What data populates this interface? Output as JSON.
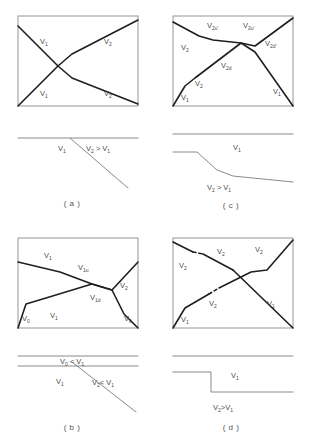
{
  "figure": {
    "panel_count": 4
  },
  "panels": {
    "a": {
      "caption": "( a )",
      "box": {
        "x": 18,
        "y": 16,
        "w": 120,
        "h": 90
      },
      "curves": [
        {
          "name": "v1-descending",
          "points": "18,26 58,66 72,78 138,104"
        },
        {
          "name": "v1-ascending",
          "points": "18,106 58,66 72,54 138,20"
        }
      ],
      "labels": [
        {
          "id": "a-lbl-v1-upper",
          "base": "V",
          "sub": "1",
          "x": 40,
          "y": 44
        },
        {
          "id": "a-lbl-v1-lower",
          "base": "V",
          "sub": "1",
          "x": 40,
          "y": 96
        },
        {
          "id": "a-lbl-v2-upper",
          "base": "V",
          "sub": "2",
          "x": 104,
          "y": 44
        },
        {
          "id": "a-lbl-v2-lower",
          "base": "V",
          "sub": "2",
          "x": 104,
          "y": 96
        }
      ],
      "profile": {
        "baseline": {
          "x1": 18,
          "y1": 138,
          "x2": 138,
          "y2": 138
        },
        "slope": {
          "x1": 70,
          "y1": 138,
          "x2": 128,
          "y2": 188
        },
        "labels": [
          {
            "id": "a-prof-v1",
            "text": "V",
            "sub": "1",
            "x": 58,
            "y": 151
          },
          {
            "id": "a-prof-cmp",
            "text": "V",
            "sub": "2",
            "tail": " > V",
            "tail_sub": "1",
            "x": 86,
            "y": 151
          }
        ]
      }
    },
    "c": {
      "caption": "( c )",
      "box": {
        "x": 18,
        "y": 16,
        "w": 120,
        "h": 90
      },
      "curves": [
        {
          "name": "v2-upper-branch",
          "points": "18,22 44,36 58,40 86,43 100,46 138,18"
        },
        {
          "name": "v2d-ascending",
          "points": "18,106 30,86 40,78 86,43 100,52 138,106"
        }
      ],
      "labels": [
        {
          "id": "c-lbl-v2",
          "base": "V",
          "sub": "2",
          "x": 26,
          "y": 48
        },
        {
          "id": "c-lbl-v2u-prime",
          "base": "V",
          "sub": "2u'",
          "x": 58,
          "y": 28
        },
        {
          "id": "c-lbl-v2b-prime",
          "base": "V",
          "sub": "2u'",
          "x": 92,
          "y": 28
        },
        {
          "id": "c-lbl-v2d-prime",
          "base": "V",
          "sub": "2d'",
          "x": 112,
          "y": 44
        },
        {
          "id": "c-lbl-v2d",
          "base": "V",
          "sub": "2d",
          "x": 70,
          "y": 68
        },
        {
          "id": "c-lbl-v2-low",
          "base": "V",
          "sub": "2",
          "x": 42,
          "y": 86
        },
        {
          "id": "c-lbl-v1-left",
          "base": "V",
          "sub": "1",
          "x": 26,
          "y": 100
        },
        {
          "id": "c-lbl-v1-right",
          "base": "V",
          "sub": "1",
          "x": 120,
          "y": 96
        }
      ],
      "profile": {
        "baseline": {
          "x1": 18,
          "y1": 134,
          "x2": 138,
          "y2": 134
        },
        "step": "18,152 42,152 62,170 78,176 138,182",
        "labels": [
          {
            "id": "c-prof-v1",
            "text": "V",
            "sub": "1",
            "x": 78,
            "y": 150
          },
          {
            "id": "c-prof-cmp",
            "text": "V",
            "sub": "2",
            "tail": " > V",
            "tail_sub": "1",
            "x": 58,
            "y": 186
          }
        ]
      }
    },
    "b": {
      "caption": "( b )",
      "box": {
        "x": 18,
        "y": 16,
        "w": 120,
        "h": 90
      },
      "curves": [
        {
          "name": "v1u-descending",
          "points": "18,40 60,50 92,62 112,68 138,40"
        },
        {
          "name": "v1d-ascending",
          "points": "18,106 26,82 46,76 92,62 112,68 124,92 138,106"
        }
      ],
      "labels": [
        {
          "id": "b-lbl-v1-top",
          "base": "V",
          "sub": "1",
          "x": 44,
          "y": 36
        },
        {
          "id": "b-lbl-v1u",
          "base": "V",
          "sub": "1u",
          "x": 80,
          "y": 48
        },
        {
          "id": "b-lbl-v2",
          "base": "V",
          "sub": "2",
          "x": 120,
          "y": 66
        },
        {
          "id": "b-lbl-v1d",
          "base": "V",
          "sub": "1d",
          "x": 92,
          "y": 78
        },
        {
          "id": "b-lbl-v0-left",
          "base": "V",
          "sub": "0",
          "x": 24,
          "y": 98
        },
        {
          "id": "b-lbl-v1-mid",
          "base": "V",
          "sub": "1",
          "x": 50,
          "y": 96
        },
        {
          "id": "b-lbl-v0-right",
          "base": "V",
          "sub": "0",
          "x": 126,
          "y": 98
        }
      ],
      "profile": {
        "line_top": {
          "x1": 18,
          "y1": 134,
          "x2": 138,
          "y2": 134
        },
        "line_bottom": {
          "x1": 18,
          "y1": 144,
          "x2": 138,
          "y2": 144
        },
        "slope": {
          "x1": 72,
          "y1": 140,
          "x2": 136,
          "y2": 190
        },
        "labels": [
          {
            "id": "b-prof-v0cmp",
            "text": "V",
            "sub": "0",
            "tail": " < V",
            "tail_sub": "1",
            "x": 64,
            "y": 141
          },
          {
            "id": "b-prof-v1",
            "text": "V",
            "sub": "1",
            "x": 58,
            "y": 161
          },
          {
            "id": "b-prof-v2cmp",
            "text": "V",
            "sub": "2",
            "tail": "< V",
            "tail_sub": "1",
            "x": 94,
            "y": 162
          }
        ]
      }
    },
    "d": {
      "caption": "( d )",
      "box": {
        "x": 18,
        "y": 16,
        "w": 120,
        "h": 90
      },
      "curves": [
        {
          "name": "v2-descending-seg1",
          "points": "18,20 38,30"
        },
        {
          "name": "v2-descending-seg2",
          "points": "48,32 78,48"
        },
        {
          "name": "v2-descending-seg3",
          "points": "78,48 138,106"
        },
        {
          "name": "v2-ascending-seg1",
          "points": "18,106 30,86 54,72"
        },
        {
          "name": "v2-ascending-seg2",
          "points": "64,66 96,50 112,48 138,18"
        }
      ],
      "dashes": [
        {
          "name": "gap-upper",
          "x1": 38,
          "y1": 30,
          "x2": 48,
          "y2": 32
        },
        {
          "name": "gap-lower",
          "x1": 54,
          "y1": 72,
          "x2": 64,
          "y2": 66
        }
      ],
      "labels": [
        {
          "id": "d-lbl-v2-left",
          "base": "V",
          "sub": "2",
          "x": 26,
          "y": 44
        },
        {
          "id": "d-lbl-v2-mid",
          "base": "V",
          "sub": "2",
          "x": 64,
          "y": 32
        },
        {
          "id": "d-lbl-v2-right",
          "base": "V",
          "sub": "2",
          "x": 100,
          "y": 30
        },
        {
          "id": "d-lbl-v2-lower",
          "base": "V",
          "sub": "2",
          "x": 56,
          "y": 84
        },
        {
          "id": "d-lbl-v1-left",
          "base": "V",
          "sub": "1",
          "x": 28,
          "y": 100
        },
        {
          "id": "d-lbl-v1-right",
          "base": "V",
          "sub": "1",
          "x": 114,
          "y": 84
        }
      ],
      "profile": {
        "baseline": {
          "x1": 18,
          "y1": 134,
          "x2": 138,
          "y2": 134
        },
        "step": "18,150 56,150 56,170 138,170",
        "labels": [
          {
            "id": "d-prof-v1",
            "text": "V",
            "sub": "1",
            "x": 78,
            "y": 154
          },
          {
            "id": "d-prof-cmp",
            "text": "V",
            "sub": "2",
            "tail": ">V",
            "tail_sub": "1",
            "x": 62,
            "y": 186
          }
        ]
      }
    }
  }
}
